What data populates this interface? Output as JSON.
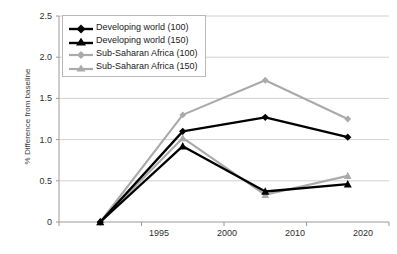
{
  "chart_data": {
    "type": "line",
    "title": "",
    "xlabel": "",
    "ylabel": "% Difference from baseline",
    "x": [
      "1995",
      "2000",
      "2010",
      "2020"
    ],
    "categories": [
      "1995",
      "2000",
      "2010",
      "2020"
    ],
    "ylim": [
      0,
      2.5
    ],
    "yticks": [
      "0",
      "0.5",
      "1.0",
      "1.5",
      "2.0",
      "2.5"
    ],
    "ytick_values": [
      0,
      0.5,
      1.0,
      1.5,
      2.0,
      2.5
    ],
    "grid": "horizontal",
    "legend_position": "top-left inside plot",
    "series": [
      {
        "name": "Developing world (100)",
        "values": [
          0,
          1.1,
          1.27,
          1.03
        ],
        "color": "#000000",
        "marker": "diamond"
      },
      {
        "name": "Developing world (150)",
        "values": [
          0,
          0.92,
          0.37,
          0.46
        ],
        "color": "#000000",
        "marker": "triangle"
      },
      {
        "name": "Sub-Saharan Africa (100)",
        "values": [
          0,
          1.3,
          1.72,
          1.25
        ],
        "color": "#aaaaaa",
        "marker": "diamond"
      },
      {
        "name": "Sub-Saharan Africa (150)",
        "values": [
          0,
          1.02,
          0.33,
          0.56
        ],
        "color": "#aaaaaa",
        "marker": "triangle"
      }
    ]
  },
  "axis": {
    "y_title": "% Difference from baseline",
    "y_labels": [
      "2.5",
      "2.0",
      "1.5",
      "1.0",
      "0.5",
      "0"
    ],
    "x_labels": [
      "1995",
      "2000",
      "2010",
      "2020"
    ]
  },
  "legend": {
    "items": [
      {
        "label": "Developing world (100)"
      },
      {
        "label": "Developing world (150)"
      },
      {
        "label": "Sub-Saharan Africa (100)"
      },
      {
        "label": "Sub-Saharan Africa (150)"
      }
    ]
  },
  "colors": {
    "series_dark": "#000000",
    "series_light": "#aaaaaa",
    "gridline": "#d0d0d0",
    "axis": "#9a9a9a",
    "text": "#2e2e2e",
    "background": "#ffffff"
  }
}
